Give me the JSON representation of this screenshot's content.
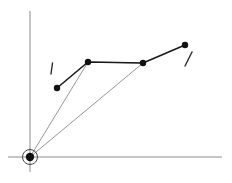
{
  "figure": {
    "title": "",
    "background_color": "#ffffff",
    "width": 232,
    "height": 183
  },
  "chart_data": {
    "type": "scatter",
    "title": "",
    "xlabel": "",
    "ylabel": "",
    "grid": false,
    "legend": null,
    "axes": {
      "origin": {
        "x": 30,
        "y": 157,
        "label": "origin"
      },
      "x_axis": {
        "x1": 8,
        "y1": 157,
        "x2": 222,
        "y2": 157,
        "color": "#8a8a8a",
        "arrow": false
      },
      "y_axis": {
        "x1": 30,
        "y1": 172,
        "x2": 30,
        "y2": 11,
        "color": "#8a8a8a",
        "arrow": false
      }
    },
    "origin_marker": {
      "name": "origin-node",
      "cx": 30,
      "cy": 157,
      "dot_radius": 4.2,
      "ring_radius": 7.5,
      "dot_color": "#111111",
      "ring_color": "#444444"
    },
    "polyline": {
      "name": "vertex-path",
      "color": "#1a1a1a",
      "width": 1.6,
      "points": [
        {
          "id": "p1",
          "x": 57,
          "y": 88
        },
        {
          "id": "p2",
          "x": 88,
          "y": 62
        },
        {
          "id": "p3",
          "x": 143,
          "y": 63
        },
        {
          "id": "p4",
          "x": 185,
          "y": 45
        }
      ]
    },
    "vertex_markers": {
      "radius": 3.2,
      "color": "#111111",
      "points": [
        {
          "id": "p1",
          "x": 57,
          "y": 88
        },
        {
          "id": "p2",
          "x": 88,
          "y": 62
        },
        {
          "id": "p3",
          "x": 143,
          "y": 63
        },
        {
          "id": "p4",
          "x": 185,
          "y": 45
        }
      ]
    },
    "hatched_region": {
      "name": "shaded-triangle",
      "vertices": [
        {
          "x": 30,
          "y": 157
        },
        {
          "x": 88,
          "y": 62
        },
        {
          "x": 143,
          "y": 63
        }
      ],
      "hatch_orientation": "vertical",
      "hatch_spacing": 2.2,
      "hatch_color": "#9b9b9b",
      "hatch_width": 0.7,
      "outline_color": "#7d7d7d",
      "outline_width": 0.8,
      "fill_color": "#ffffff"
    },
    "tick_marks": [
      {
        "id": "left-tick",
        "x1": 52.5,
        "y1": 63,
        "x2": 51.0,
        "y2": 74,
        "color": "#2b2b2b",
        "width": 1.4
      },
      {
        "id": "right-tick",
        "x1": 192,
        "y1": 52,
        "x2": 185,
        "y2": 66,
        "color": "#2b2b2b",
        "width": 1.4
      }
    ]
  }
}
